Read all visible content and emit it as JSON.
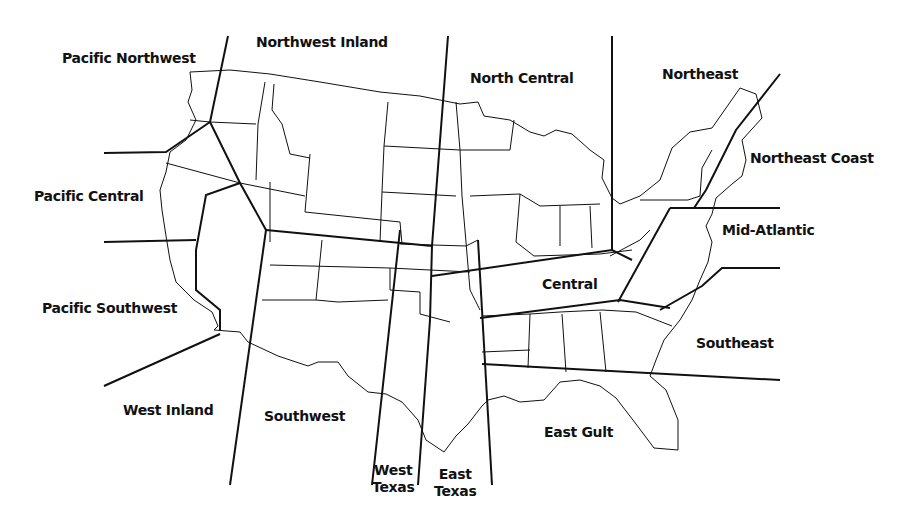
{
  "map": {
    "title": "",
    "type": "US regional boundary map",
    "line_color": "#111111",
    "background": "#ffffff",
    "regions": [
      {
        "id": "pacific-northwest",
        "label": "Pacific Northwest",
        "x": 62,
        "y": 50
      },
      {
        "id": "northwest-inland",
        "label": "Northwest Inland",
        "x": 256,
        "y": 34
      },
      {
        "id": "north-central",
        "label": "North Central",
        "x": 470,
        "y": 70
      },
      {
        "id": "northeast",
        "label": "Northeast",
        "x": 662,
        "y": 66
      },
      {
        "id": "northeast-coast",
        "label": "Northeast Coast",
        "x": 750,
        "y": 150
      },
      {
        "id": "pacific-central",
        "label": "Pacific Central",
        "x": 34,
        "y": 188
      },
      {
        "id": "mid-atlantic",
        "label": "Mid-Atlantic",
        "x": 722,
        "y": 222
      },
      {
        "id": "central",
        "label": "Central",
        "x": 542,
        "y": 276
      },
      {
        "id": "pacific-southwest",
        "label": "Pacific Southwest",
        "x": 42,
        "y": 300
      },
      {
        "id": "southeast",
        "label": "Southeast",
        "x": 696,
        "y": 335
      },
      {
        "id": "west-inland",
        "label": "West Inland",
        "x": 123,
        "y": 402
      },
      {
        "id": "southwest",
        "label": "Southwest",
        "x": 264,
        "y": 408
      },
      {
        "id": "east-gult",
        "label": "East Gult",
        "x": 544,
        "y": 424
      },
      {
        "id": "west-texas",
        "label_line1": "West",
        "label_line2": "Texas",
        "x": 372,
        "y": 462
      },
      {
        "id": "east-texas",
        "label_line1": "East",
        "label_line2": "Texas",
        "x": 434,
        "y": 466
      }
    ]
  }
}
